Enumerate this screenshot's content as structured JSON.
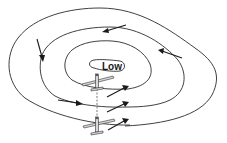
{
  "diagram": {
    "center_label": "Low",
    "elements": {
      "isobars": [
        "outer-isobar",
        "middle-isobar",
        "inner-isobar",
        "low-center-isobar"
      ],
      "aircraft": [
        "upper-aircraft",
        "lower-aircraft"
      ],
      "wind_arrows": 9
    },
    "colors": {
      "line": "#2a2a2a",
      "background": "#ffffff",
      "aircraft_fill": "#d8d8d8"
    }
  }
}
